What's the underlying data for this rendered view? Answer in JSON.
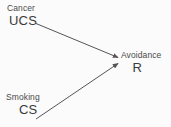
{
  "diagram": {
    "type": "classical-conditioning-flow",
    "background_color": "#fbfbfb",
    "line_color": "#555555",
    "text_color": "#3c3c3c",
    "nodes": [
      {
        "id": "ucs",
        "title": "Cancer",
        "code": "UCS",
        "position": "top-left"
      },
      {
        "id": "cs",
        "title": "Smoking",
        "code": "CS",
        "position": "bottom-left"
      },
      {
        "id": "avoidance",
        "title": "Avoidance",
        "code": "R",
        "position": "right-middle"
      }
    ],
    "arrows": [
      {
        "id": "ucs-to-avoidance",
        "from": "ucs",
        "to": "avoidance",
        "direction": "down-right"
      },
      {
        "id": "cs-to-avoidance",
        "from": "cs",
        "to": "avoidance",
        "direction": "up-right"
      }
    ]
  }
}
